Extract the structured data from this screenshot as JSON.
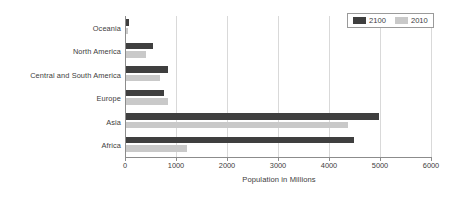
{
  "chart_data": {
    "type": "bar",
    "orientation": "horizontal",
    "title": "",
    "xlabel": "Population in Millions",
    "ylabel": "",
    "xlim": [
      0,
      6000
    ],
    "xticks": [
      0,
      1000,
      2000,
      3000,
      4000,
      5000,
      6000
    ],
    "xtick_labels": [
      "0",
      "1000",
      "2000",
      "3000",
      "4000",
      "5000",
      "6000"
    ],
    "grid": true,
    "grid_axis": "x",
    "legend_position": "top-right",
    "categories": [
      "Oceania",
      "North America",
      "Central and South America",
      "Europe",
      "Asia",
      "Africa"
    ],
    "series": [
      {
        "name": "2100",
        "color": "#3f3f3f",
        "values": [
          50,
          530,
          820,
          740,
          4960,
          4470
        ]
      },
      {
        "name": "2010",
        "color": "#c9c9c9",
        "values": [
          40,
          390,
          670,
          820,
          4350,
          1190
        ]
      }
    ]
  },
  "legend": {
    "items": [
      {
        "label": "2100",
        "swatch": "dark-swatch-icon"
      },
      {
        "label": "2010",
        "swatch": "light-swatch-icon"
      }
    ]
  },
  "colors": {
    "series_2100": "#3f3f3f",
    "series_2010": "#c9c9c9",
    "gridline": "#d9d9d9",
    "axis": "#8c8c8c",
    "text": "#3d3d3d",
    "background": "#ffffff"
  }
}
